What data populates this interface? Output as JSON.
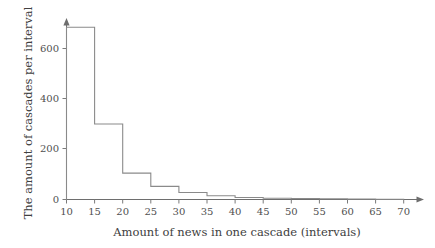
{
  "chart_data": {
    "type": "bar",
    "title": "",
    "subtitle": "",
    "xlabel": "Amount of news in one cascade (intervals)",
    "ylabel": "The amount of cascades per interval",
    "grid": false,
    "legend": "none",
    "xlim": [
      10,
      72
    ],
    "ylim": [
      0,
      700
    ],
    "xticks": [
      10,
      15,
      20,
      25,
      30,
      35,
      40,
      45,
      50,
      55,
      60,
      65,
      70
    ],
    "xtick_labels": [
      "10",
      "15",
      "20",
      "25",
      "30",
      "35",
      "40",
      "45",
      "50",
      "55",
      "60",
      "65",
      "70"
    ],
    "yticks": [
      0,
      200,
      400,
      600
    ],
    "ytick_labels": [
      "0",
      "200",
      "400",
      "600"
    ],
    "bin_width": 5,
    "bin_edges": [
      10,
      15,
      20,
      25,
      30,
      35,
      40,
      45,
      50,
      55,
      60,
      65,
      70
    ],
    "categories": [
      "10-15",
      "15-20",
      "20-25",
      "25-30",
      "30-35",
      "35-40",
      "40-45",
      "45-50",
      "50-55",
      "55-60",
      "60-65",
      "65-70"
    ],
    "values": [
      685,
      300,
      105,
      52,
      28,
      15,
      8,
      5,
      4,
      3,
      2,
      1
    ],
    "series": [
      {
        "name": "The amount of cascades per interval",
        "values": [
          685,
          300,
          105,
          52,
          28,
          15,
          8,
          5,
          4,
          3,
          2,
          1
        ]
      }
    ],
    "style": {
      "line_color": "#8a8a8a",
      "axis_color": "#6e6e6e",
      "text_color": "#404040",
      "background": "#ffffff"
    }
  },
  "axis_labels": {
    "x_title": "Amount of news in one cascade (intervals)",
    "y_title": "The amount of cascades per interval"
  },
  "ticks": {
    "x": [
      "10",
      "15",
      "20",
      "25",
      "30",
      "35",
      "40",
      "45",
      "50",
      "55",
      "60",
      "65",
      "70"
    ],
    "y": [
      "0",
      "200",
      "400",
      "600"
    ]
  }
}
